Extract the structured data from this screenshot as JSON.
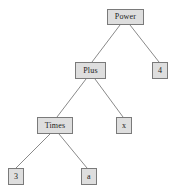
{
  "diagram": {
    "type": "expression-tree",
    "title": "",
    "width": 178,
    "height": 196,
    "background_color": "#ffffff",
    "node_fill_color": "#dedede",
    "node_border_color": "#7a7a7a",
    "edge_color": "#8a8a8a",
    "text_color": "#1a1a1a",
    "nodes": [
      {
        "id": "power",
        "label": "Power",
        "x": 107,
        "y": 9,
        "w": 37,
        "h": 16
      },
      {
        "id": "four",
        "label": "4",
        "x": 152,
        "y": 62,
        "w": 16,
        "h": 17
      },
      {
        "id": "plus",
        "label": "Plus",
        "x": 75,
        "y": 62,
        "w": 31,
        "h": 17
      },
      {
        "id": "times",
        "label": "Times",
        "x": 37,
        "y": 117,
        "w": 36,
        "h": 17
      },
      {
        "id": "x",
        "label": "x",
        "x": 116,
        "y": 117,
        "w": 16,
        "h": 17
      },
      {
        "id": "three",
        "label": "3",
        "x": 8,
        "y": 168,
        "w": 16,
        "h": 17
      },
      {
        "id": "a",
        "label": "a",
        "x": 81,
        "y": 168,
        "w": 16,
        "h": 17
      }
    ],
    "edges": [
      {
        "from": "power",
        "to": "plus",
        "x1": 120,
        "y1": 25,
        "x2": 92,
        "y2": 62
      },
      {
        "from": "power",
        "to": "four",
        "x1": 130,
        "y1": 25,
        "x2": 159,
        "y2": 62
      },
      {
        "from": "plus",
        "to": "times",
        "x1": 86,
        "y1": 79,
        "x2": 57,
        "y2": 117
      },
      {
        "from": "plus",
        "to": "x",
        "x1": 95,
        "y1": 79,
        "x2": 123,
        "y2": 117
      },
      {
        "from": "times",
        "to": "three",
        "x1": 50,
        "y1": 134,
        "x2": 16,
        "y2": 168
      },
      {
        "from": "times",
        "to": "a",
        "x1": 59,
        "y1": 134,
        "x2": 87,
        "y2": 168
      }
    ]
  }
}
